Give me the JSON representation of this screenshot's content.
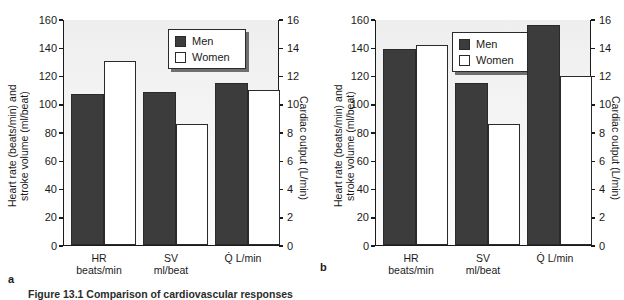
{
  "figure": {
    "caption": "Figure 13.1 Comparison of cardiovascular responses",
    "panels": [
      {
        "letter": "a"
      },
      {
        "letter": "b"
      }
    ]
  },
  "axes": {
    "ylabel_left": "Heart rate (beats/min) and\nstroke volume (ml/beat)",
    "ylabel_right": "Cardiac output (L/min)",
    "left_ticks": [
      "160",
      "140",
      "120",
      "100",
      "80",
      "60",
      "40",
      "20",
      "0"
    ],
    "right_ticks": [
      "16",
      "14",
      "12",
      "10",
      "8",
      "6",
      "4",
      "2",
      "0"
    ],
    "categories": [
      "HR\nbeats/min",
      "SV\nml/beat",
      "Q̇ L/min"
    ]
  },
  "legend": {
    "men_label": "Men",
    "women_label": "Women",
    "men_color": "#3c3c3c",
    "women_color": "#ffffff"
  },
  "chart_data": [
    {
      "type": "bar",
      "panel": "a",
      "title": "",
      "xlabel": "",
      "ylabel": "Heart rate (beats/min) and stroke volume (ml/beat)",
      "ylabel_secondary": "Cardiac output (L/min)",
      "categories": [
        "HR beats/min",
        "SV ml/beat",
        "Q̇ L/min"
      ],
      "ylim": [
        0,
        160
      ],
      "ylim_secondary": [
        0,
        16
      ],
      "yticks": [
        0,
        20,
        40,
        60,
        80,
        100,
        120,
        140,
        160
      ],
      "yticks_secondary": [
        0,
        2,
        4,
        6,
        8,
        10,
        12,
        14,
        16
      ],
      "grid": false,
      "legend_position": "top-right",
      "series": [
        {
          "name": "Men",
          "values": [
            107,
            108,
            114.5
          ],
          "color": "#3c3c3c"
        },
        {
          "name": "Women",
          "values": [
            130,
            85.5,
            110
          ],
          "color": "#ffffff"
        }
      ],
      "secondary_axis_values": {
        "Men": {
          "Q̇ L/min": 11.45
        },
        "Women": {
          "Q̇ L/min": 11.0
        }
      }
    },
    {
      "type": "bar",
      "panel": "b",
      "title": "",
      "xlabel": "",
      "ylabel": "Heart rate (beats/min) and stroke volume (ml/beat)",
      "ylabel_secondary": "Cardiac output (L/min)",
      "categories": [
        "HR beats/min",
        "SV ml/beat",
        "Q̇ L/min"
      ],
      "ylim": [
        0,
        160
      ],
      "ylim_secondary": [
        0,
        16
      ],
      "yticks": [
        0,
        20,
        40,
        60,
        80,
        100,
        120,
        140,
        160
      ],
      "yticks_secondary": [
        0,
        2,
        4,
        6,
        8,
        10,
        12,
        14,
        16
      ],
      "grid": false,
      "legend_position": "top-center",
      "series": [
        {
          "name": "Men",
          "values": [
            139,
            115,
            156
          ],
          "color": "#3c3c3c"
        },
        {
          "name": "Women",
          "values": [
            141.5,
            86,
            120
          ],
          "color": "#ffffff"
        }
      ],
      "secondary_axis_values": {
        "Men": {
          "Q̇ L/min": 15.6
        },
        "Women": {
          "Q̇ L/min": 12.0
        }
      }
    }
  ]
}
